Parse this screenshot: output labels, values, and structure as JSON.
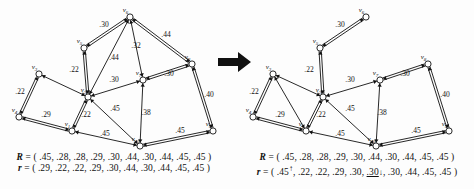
{
  "figure": {
    "background": "#fdfdfd",
    "ink": "#111111",
    "separator_arrow": "right-arrow"
  },
  "panels": [
    {
      "id": "before",
      "name": "left-graph-panel",
      "nodes": [
        {
          "id": "v1",
          "label": "v",
          "sub": "1",
          "x": 72,
          "y": 131,
          "filled": false
        },
        {
          "id": "v2",
          "label": "v",
          "sub": "2",
          "x": 88,
          "y": 97,
          "filled": false
        },
        {
          "id": "v3",
          "label": "v",
          "sub": "3",
          "x": 39,
          "y": 74,
          "filled": false
        },
        {
          "id": "v4",
          "label": "v",
          "sub": "4",
          "x": 19,
          "y": 117,
          "filled": false
        },
        {
          "id": "v5",
          "label": "v",
          "sub": "5",
          "x": 84,
          "y": 48,
          "filled": false
        },
        {
          "id": "v6",
          "label": "v",
          "sub": "6",
          "x": 130,
          "y": 17,
          "filled": false
        },
        {
          "id": "v7",
          "label": "v",
          "sub": "7",
          "x": 143,
          "y": 80,
          "filled": false
        },
        {
          "id": "v8",
          "label": "v",
          "sub": "8",
          "x": 192,
          "y": 64,
          "filled": false
        },
        {
          "id": "v9",
          "label": "v",
          "sub": "9",
          "x": 213,
          "y": 131,
          "filled": false
        },
        {
          "id": "v10",
          "label": "v",
          "sub": "10",
          "x": 140,
          "y": 146,
          "filled": false
        }
      ],
      "edges": [
        {
          "from": "v5",
          "to": "v6",
          "weight": ".30",
          "lx": 104,
          "ly": 27,
          "double": true
        },
        {
          "from": "v5",
          "to": "v2",
          "weight": ".22",
          "lx": 74,
          "ly": 72,
          "double": true
        },
        {
          "from": "v2",
          "to": "v6",
          "weight": ".44",
          "lx": 114,
          "ly": 60,
          "double": false
        },
        {
          "from": "v7",
          "to": "v6",
          "weight": ".32",
          "lx": 136,
          "ly": 48,
          "double": false
        },
        {
          "from": "v6",
          "to": "v8",
          "weight": ".44",
          "lx": 166,
          "ly": 37,
          "double": true
        },
        {
          "from": "v2",
          "to": "v7",
          "weight": ".30",
          "lx": 114,
          "ly": 82,
          "double": false
        },
        {
          "from": "v7",
          "to": "v8",
          "weight": ".30",
          "lx": 169,
          "ly": 76,
          "double": true
        },
        {
          "from": "v8",
          "to": "v9",
          "weight": ".40",
          "lx": 209,
          "ly": 97,
          "double": true
        },
        {
          "from": "v3",
          "to": "v4",
          "weight": ".22",
          "lx": 20,
          "ly": 94,
          "double": true
        },
        {
          "from": "v4",
          "to": "v1",
          "weight": ".29",
          "lx": 46,
          "ly": 117,
          "double": true
        },
        {
          "from": "v1",
          "to": "v2",
          "weight": ".22",
          "lx": 86,
          "ly": 117,
          "double": true
        },
        {
          "from": "v2",
          "to": "v10",
          "weight": ".45",
          "lx": 115,
          "ly": 111,
          "double": false
        },
        {
          "from": "v1",
          "to": "v10",
          "weight": ".45",
          "lx": 105,
          "ly": 136,
          "double": false
        },
        {
          "from": "v7",
          "to": "v10",
          "weight": ".38",
          "lx": 146,
          "ly": 115,
          "double": false
        },
        {
          "from": "v10",
          "to": "v9",
          "weight": ".45",
          "lx": 180,
          "ly": 133,
          "double": true
        },
        {
          "from": "v3",
          "to": "v2",
          "weight": "",
          "lx": 0,
          "ly": 0,
          "double": false
        }
      ],
      "equations": {
        "R": {
          "name": "R",
          "values": [
            ".45",
            ".28",
            ".28",
            ".29",
            ".30",
            ".44",
            ".30",
            ".44",
            ".45",
            ".45"
          ],
          "marks": [
            "",
            "",
            "",
            "",
            "",
            "",
            "",
            "",
            "",
            ""
          ],
          "underline": [
            false,
            false,
            false,
            false,
            false,
            false,
            false,
            false,
            false,
            false
          ]
        },
        "r": {
          "name": "r",
          "values": [
            ".29",
            ".22",
            ".22",
            ".29",
            ".30",
            ".44",
            ".30",
            ".44",
            ".45",
            ".45"
          ],
          "marks": [
            "",
            "",
            "",
            "",
            "",
            "",
            "",
            "",
            "",
            ""
          ],
          "underline": [
            false,
            false,
            false,
            false,
            false,
            false,
            false,
            false,
            false,
            false
          ]
        }
      }
    },
    {
      "id": "after",
      "name": "right-graph-panel",
      "nodes": [
        {
          "id": "v1",
          "label": "v",
          "sub": "1",
          "x": 66,
          "y": 131,
          "filled": false
        },
        {
          "id": "v2",
          "label": "v",
          "sub": "2",
          "x": 83,
          "y": 97,
          "filled": false
        },
        {
          "id": "v3",
          "label": "v",
          "sub": "3",
          "x": 33,
          "y": 74,
          "filled": false
        },
        {
          "id": "v4",
          "label": "v",
          "sub": "4",
          "x": 13,
          "y": 117,
          "filled": false
        },
        {
          "id": "v5",
          "label": "v",
          "sub": "5",
          "x": 80,
          "y": 48,
          "filled": false
        },
        {
          "id": "v6",
          "label": "v",
          "sub": "6",
          "x": 126,
          "y": 17,
          "filled": false
        },
        {
          "id": "v7",
          "label": "v",
          "sub": "7",
          "x": 140,
          "y": 80,
          "filled": false
        },
        {
          "id": "v8",
          "label": "v",
          "sub": "8",
          "x": 188,
          "y": 64,
          "filled": false
        },
        {
          "id": "v9",
          "label": "v",
          "sub": "9",
          "x": 209,
          "y": 131,
          "filled": false
        },
        {
          "id": "v10",
          "label": "v",
          "sub": "10",
          "x": 136,
          "y": 146,
          "filled": false
        }
      ],
      "edges": [
        {
          "from": "v5",
          "to": "v6",
          "weight": ".30",
          "lx": 100,
          "ly": 27,
          "double": true
        },
        {
          "from": "v5",
          "to": "v2",
          "weight": ".22",
          "lx": 69,
          "ly": 72,
          "double": true
        },
        {
          "from": "v2",
          "to": "v7",
          "weight": ".30",
          "lx": 110,
          "ly": 82,
          "double": false
        },
        {
          "from": "v7",
          "to": "v8",
          "weight": ".30",
          "lx": 165,
          "ly": 76,
          "double": true
        },
        {
          "from": "v8",
          "to": "v9",
          "weight": ".40",
          "lx": 205,
          "ly": 97,
          "double": true
        },
        {
          "from": "v3",
          "to": "v4",
          "weight": ".22",
          "lx": 14,
          "ly": 94,
          "double": true
        },
        {
          "from": "v4",
          "to": "v1",
          "weight": ".29",
          "lx": 40,
          "ly": 117,
          "double": true
        },
        {
          "from": "v1",
          "to": "v2",
          "weight": ".22",
          "lx": 81,
          "ly": 117,
          "double": true
        },
        {
          "from": "v2",
          "to": "v10",
          "weight": ".45",
          "lx": 110,
          "ly": 111,
          "double": false
        },
        {
          "from": "v1",
          "to": "v10",
          "weight": ".45",
          "lx": 100,
          "ly": 136,
          "double": false
        },
        {
          "from": "v7",
          "to": "v10",
          "weight": ".38",
          "lx": 142,
          "ly": 115,
          "double": false
        },
        {
          "from": "v10",
          "to": "v9",
          "weight": ".45",
          "lx": 176,
          "ly": 133,
          "double": true
        },
        {
          "from": "v3",
          "to": "v2",
          "weight": "",
          "lx": 0,
          "ly": 0,
          "double": false
        },
        {
          "from": "v3",
          "to": "v1",
          "weight": "",
          "lx": 0,
          "ly": 0,
          "double": false
        }
      ],
      "equations": {
        "R": {
          "name": "R",
          "values": [
            ".45",
            ".28",
            ".28",
            ".29",
            ".30",
            ".44",
            ".30",
            ".44",
            ".45",
            ".45"
          ],
          "marks": [
            "",
            "",
            "",
            "",
            "",
            "",
            "",
            "",
            "",
            ""
          ],
          "underline": [
            false,
            false,
            false,
            false,
            false,
            false,
            false,
            false,
            false,
            false
          ]
        },
        "r": {
          "name": "r",
          "values": [
            ".45",
            ".22",
            ".22",
            ".29",
            ".30",
            ".30",
            ".30",
            ".44",
            ".45",
            ".45"
          ],
          "marks": [
            "↑",
            "",
            "",
            "",
            "",
            "↓",
            "",
            "",
            "",
            ""
          ],
          "underline": [
            false,
            false,
            false,
            false,
            false,
            true,
            false,
            false,
            false,
            false
          ]
        }
      }
    }
  ]
}
